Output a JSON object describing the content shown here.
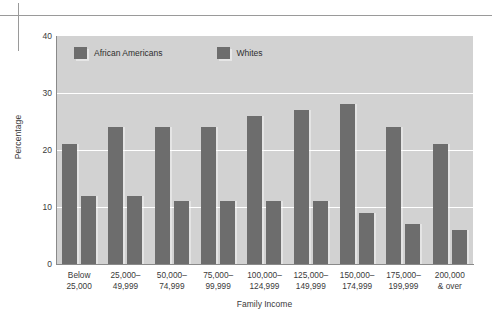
{
  "figure": {
    "axis_y_title": "Percentage",
    "axis_x_title": "Family Income",
    "y_ticks": [
      "40",
      "30",
      "20",
      "10",
      "0"
    ],
    "legend": [
      {
        "label": "African Americans",
        "color": "#6d6d6d"
      },
      {
        "label": "Whites",
        "color": "#6d6d6d"
      }
    ]
  },
  "chart_data": {
    "type": "bar",
    "title": "",
    "xlabel": "Family Income",
    "ylabel": "Percentage",
    "ylim": [
      0,
      40
    ],
    "yticks": [
      0,
      10,
      20,
      30,
      40
    ],
    "grid": true,
    "legend_position": "top-inside",
    "categories": [
      "Below\n25,000",
      "25,000–\n49,999",
      "50,000–\n74,999",
      "75,000–\n99,999",
      "100,000–\n124,999",
      "125,000–\n149,999",
      "150,000–\n174,999",
      "175,000–\n199,999",
      "200,000\n& over"
    ],
    "series": [
      {
        "name": "African Americans",
        "color": "#6d6d6d",
        "values": [
          21,
          24,
          24,
          24,
          26,
          27,
          28,
          24,
          21
        ]
      },
      {
        "name": "Whites",
        "color": "#6d6d6d",
        "values": [
          12,
          12,
          11,
          11,
          11,
          11,
          9,
          7,
          6
        ]
      }
    ]
  },
  "colors": {
    "plot_background": "#d2d2d2",
    "gridline": "#ffffff",
    "bar": "#6d6d6d",
    "axis": "#8a8a8a",
    "text": "#3a3a3a",
    "page_rule": "#9a9a9a"
  }
}
